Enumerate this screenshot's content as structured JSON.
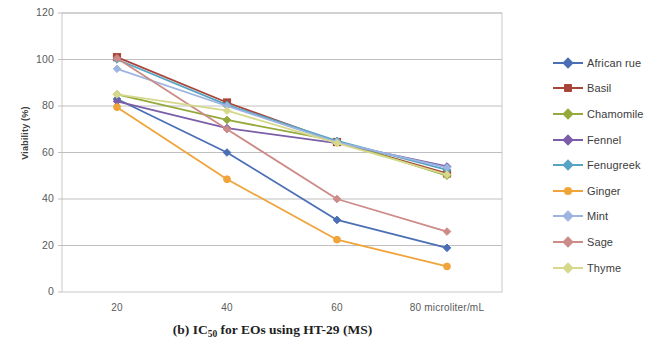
{
  "caption": {
    "prefix": "(b) IC",
    "subscript": "50",
    "suffix": " for EOs using HT-29 (MS)",
    "full": "(b) IC50 for EOs using HT-29 (MS)"
  },
  "chart_data": {
    "type": "line",
    "title": "",
    "xlabel": "",
    "ylabel": "Viability (%)",
    "x": [
      20,
      40,
      60,
      80
    ],
    "categories": [
      "20",
      "40",
      "60",
      "80 microliter/mL"
    ],
    "xtick_labels": [
      "20",
      "40",
      "60",
      "80 microliter/mL"
    ],
    "ytick_labels": [
      "0",
      "20",
      "40",
      "60",
      "80",
      "100",
      "120"
    ],
    "yticks": [
      0,
      20,
      40,
      60,
      80,
      100,
      120
    ],
    "ylim": [
      0,
      120
    ],
    "grid": "horizontal",
    "legend_position": "right",
    "series": [
      {
        "name": "African rue",
        "color": "#4a6fb5",
        "marker": "diamond",
        "values": [
          83,
          60,
          31,
          19
        ]
      },
      {
        "name": "Basil",
        "color": "#a8453a",
        "marker": "square",
        "values": [
          101,
          81.5,
          64.5,
          51
        ]
      },
      {
        "name": "Chamomile",
        "color": "#95a93c",
        "marker": "diamond",
        "values": [
          85,
          74,
          65,
          50
        ]
      },
      {
        "name": "Fennel",
        "color": "#7b5ea7",
        "marker": "diamond",
        "values": [
          82,
          70.5,
          64,
          54
        ]
      },
      {
        "name": "Fenugreek",
        "color": "#55a4c4",
        "marker": "diamond",
        "values": [
          100,
          80.5,
          65,
          52.5
        ]
      },
      {
        "name": "Ginger",
        "color": "#f0a43a",
        "marker": "circle",
        "values": [
          79.5,
          48.5,
          22.5,
          11
        ]
      },
      {
        "name": "Mint",
        "color": "#9db4e0",
        "marker": "diamond",
        "values": [
          96,
          80,
          64.5,
          53.5
        ]
      },
      {
        "name": "Sage",
        "color": "#cc8b86",
        "marker": "diamond",
        "values": [
          100.5,
          70,
          40,
          26
        ]
      },
      {
        "name": "Thyme",
        "color": "#d6d98a",
        "marker": "diamond",
        "values": [
          85,
          78,
          64,
          50.5
        ]
      }
    ]
  }
}
